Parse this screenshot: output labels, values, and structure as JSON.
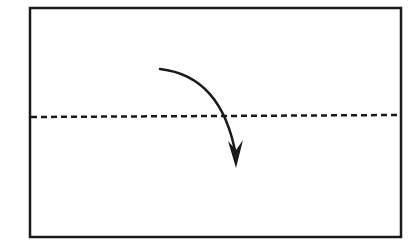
{
  "diagram": {
    "type": "fold-instruction",
    "colors": {
      "background": "#ffffff",
      "ink": "#1a1a1a"
    },
    "paper": {
      "x": 30,
      "y": 8,
      "width": 371,
      "height": 229,
      "stroke_width": 2.5
    },
    "fold_line": {
      "style": "dashed",
      "x1": 31,
      "y1": 117,
      "x2": 400,
      "y2": 115,
      "dash": "6 4",
      "stroke_width": 2.5
    },
    "fold_arrow": {
      "icon": "curved-arrow-down-icon",
      "path": "M160 69 Q 222 76 236 156",
      "stroke_width": 2.5,
      "head": "228,141 236,168 243,140 236,150"
    }
  }
}
